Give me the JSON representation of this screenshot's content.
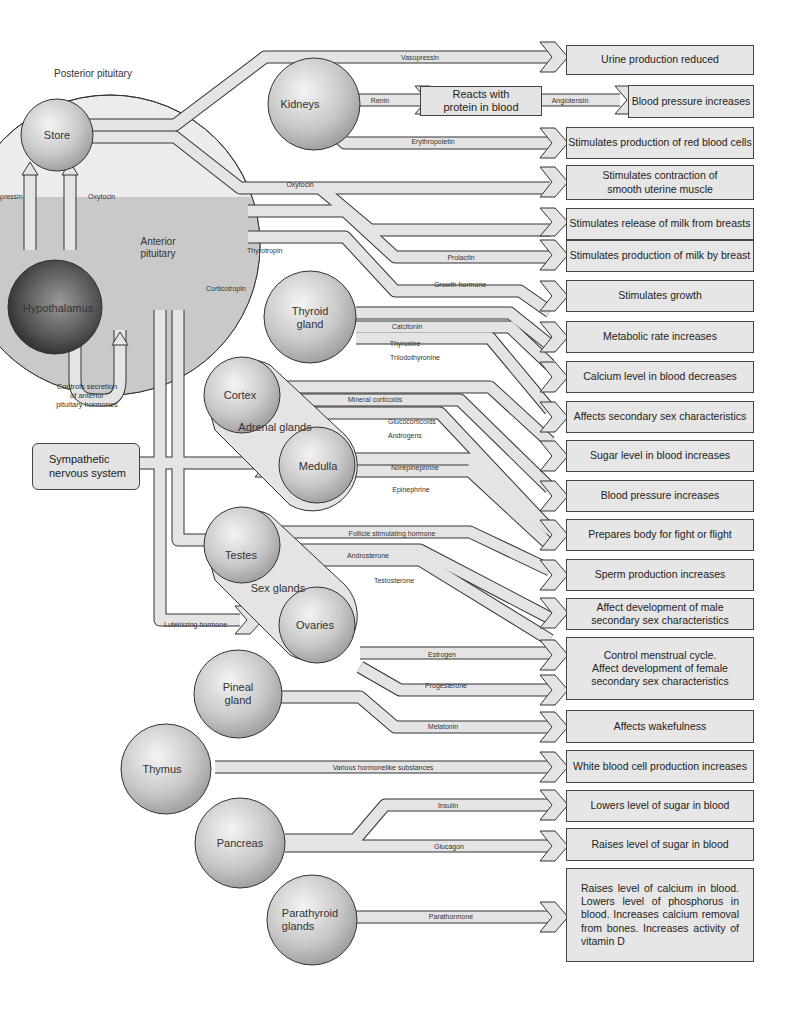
{
  "regions": {
    "posterior": "Posterior pituitary",
    "anterior": "Anterior\npituitary",
    "controls": "Controls secretion\nof anterior\npituitary hormones"
  },
  "glands": {
    "store": "Store",
    "hypothalamus": "Hypothalamus",
    "kidneys": "Kidneys",
    "thyroid": "Thyroid\ngland",
    "cortex": "Cortex",
    "adrenal": "Adrenal glands",
    "medulla": "Medulla",
    "testes": "Testes",
    "sex_glands": "Sex glands",
    "ovaries": "Ovaries",
    "pineal": "Pineal\ngland",
    "thymus": "Thymus",
    "pancreas": "Pancreas",
    "parathyroid": "Parathyroid\nglands"
  },
  "boxes": {
    "sympathetic": "Sympathetic\nnervous system",
    "reacts": "Reacts with\nprotein in blood"
  },
  "hormones": {
    "vasopressin_left": "pressin",
    "oxytocin_left": "Oxytocin",
    "vasopressin": "Vasopressin",
    "renin": "Renin",
    "angiotensin": "Angiotensin",
    "erythropoietin": "Erythropoietin",
    "oxytocin": "Oxytocin",
    "thyrotropin": "Thyrotropin",
    "prolactin": "Prolactin",
    "growth_hormone": "Growth hormone",
    "corticotropin": "Corticotropin",
    "calcitonin": "Calcitonin",
    "thyroxine": "Thyroxine",
    "triiodothyronine": "Triiodothyronine",
    "mineral_corticoids": "Mineral corticoids",
    "glucocorticoids": "Glucocorticoids",
    "androgens": "Androgens",
    "norepinephrine": "Norepinephrine",
    "epinephrine": "Epinephrine",
    "fsh": "Follicle stimulating hormone",
    "androsterone": "Androsterone",
    "testosterone": "Testosterone",
    "luteinizing": "Luteinizing hormone",
    "estrogen": "Estrogen",
    "progesterone": "Progesterone",
    "melatonin": "Melatonin",
    "various": "Various hormonelike substances",
    "insulin": "Insulin",
    "glucagon": "Glucagon",
    "parathormone": "Parathormone"
  },
  "effects": [
    "Urine production reduced",
    "Blood pressure increases",
    "Stimulates production of red blood cells",
    "Stimulates contraction of\nsmooth uterine muscle",
    "Stimulates release of milk from breasts",
    "Stimulates production of milk by breast",
    "Stimulates growth",
    "Metabolic rate increases",
    "Calcium level in blood decreases",
    "Affects secondary sex characteristics",
    "Sugar level in blood increases",
    "Blood pressure increases",
    "Prepares body for fight or flight",
    "Sperm production increases",
    "Affect development of male\nsecondary sex characteristics",
    "Control menstrual cycle.\nAffect development of female\nsecondary sex characteristics",
    "Affects wakefulness",
    "White blood cell production increases",
    "Lowers level of sugar in blood",
    "Raises level of sugar in blood",
    "Raises level of calcium in blood. Lowers level of phosphorus in blood. Increases calcium removal from bones. Increases activity of vitamin D"
  ],
  "colors": {
    "pipe_fill": "#e4e4e4",
    "pipe_stroke": "#333333",
    "anterior_fill": "#c9c9c9",
    "posterior_fill": "#ececec",
    "box_fill": "#e6e6e6"
  }
}
